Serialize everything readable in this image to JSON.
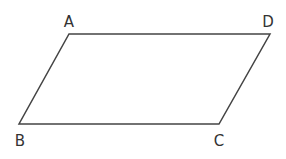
{
  "diagram": {
    "type": "parallelogram",
    "stroke_color": "#444444",
    "vertices": [
      {
        "label": "A",
        "x": 69,
        "y": 34,
        "lx": 69,
        "ly": 27
      },
      {
        "label": "D",
        "x": 270,
        "y": 34,
        "lx": 268,
        "ly": 27
      },
      {
        "label": "C",
        "x": 219,
        "y": 124,
        "lx": 219,
        "ly": 146
      },
      {
        "label": "B",
        "x": 19,
        "y": 124,
        "lx": 20,
        "ly": 146
      }
    ]
  }
}
